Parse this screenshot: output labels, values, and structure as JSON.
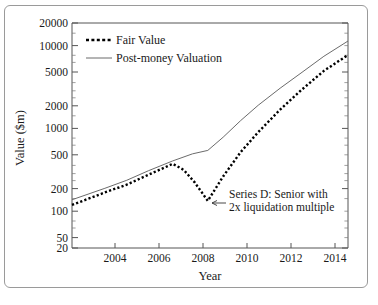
{
  "chart_data": {
    "type": "line",
    "title": "",
    "xlabel": "Year",
    "ylabel": "Value ($m)",
    "yscale": "log",
    "ylim": [
      20,
      20000
    ],
    "xlim": [
      2002.5,
      2015.1
    ],
    "grid": false,
    "legend_position": "top-left",
    "y_ticks": [
      20,
      50,
      100,
      200,
      500,
      1000,
      2000,
      5000,
      10000,
      20000
    ],
    "y_tick_labels": [
      "20",
      "50",
      "100",
      "200",
      "500",
      "1000",
      "2000",
      "5000",
      "10000",
      "20000"
    ],
    "x_ticks": [
      2004,
      2006,
      2008,
      2010,
      2012,
      2014
    ],
    "x_tick_labels": [
      "2004",
      "2006",
      "2008",
      "2010",
      "2012",
      "2014"
    ],
    "series": [
      {
        "name": "Fair Value",
        "style": "dashed",
        "color": "#000000",
        "x": [
          2002.5,
          2004.0,
          2005.0,
          2006.0,
          2007.1,
          2007.6,
          2008.1,
          2008.7,
          2009.4,
          2010.2,
          2011.0,
          2012.0,
          2013.0,
          2014.0,
          2015.1
        ],
        "y": [
          75,
          110,
          140,
          190,
          265,
          220,
          150,
          85,
          180,
          380,
          700,
          1400,
          2600,
          4600,
          7500
        ]
      },
      {
        "name": "Post-money Valuation",
        "style": "solid",
        "color": "#6b6b6b",
        "x": [
          2002.5,
          2004.0,
          2005.0,
          2006.0,
          2007.1,
          2008.0,
          2008.7,
          2009.4,
          2010.2,
          2011.0,
          2012.0,
          2013.0,
          2014.0,
          2015.1
        ],
        "y": [
          88,
          125,
          160,
          215,
          290,
          360,
          400,
          600,
          1000,
          1600,
          2700,
          4400,
          7200,
          11500
        ]
      }
    ],
    "annotations": [
      {
        "text_line_1": "Series D: Senior with",
        "text_line_2": "2x liquidation multiple",
        "points_to_x": 2008.7,
        "points_to_y": 85,
        "arrow": "left-arrow"
      }
    ]
  },
  "legend": {
    "items": [
      {
        "label": "Fair Value"
      },
      {
        "label": "Post-money Valuation"
      }
    ]
  },
  "axes": {
    "x_title": "Year",
    "y_title": "Value ($m)"
  }
}
